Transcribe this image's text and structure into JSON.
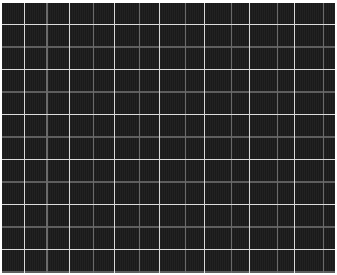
{
  "image": {
    "description": "Dark plaid fabric texture with white grid lines",
    "colors": {
      "background": "#1e1e1e",
      "bright_line": "#d8d8d8",
      "dim_line": "#5e5e5e",
      "border": "#ffffff"
    },
    "grid_period_px": 22.5
  }
}
